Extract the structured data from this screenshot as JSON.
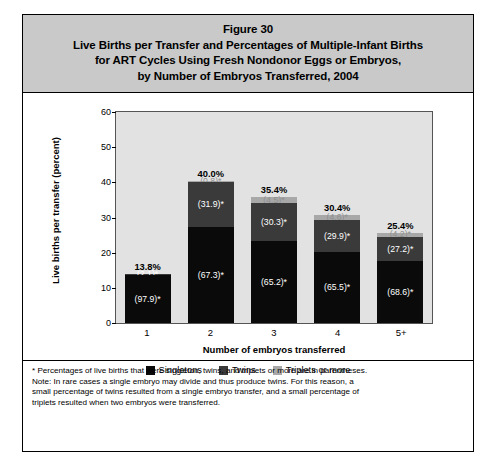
{
  "figure": {
    "title_lines": [
      "Figure 30",
      "Live Births per Transfer and Percentages of Multiple-Infant Births",
      "for ART Cycles Using Fresh Nondonor Eggs or Embryos,",
      "by Number of Embryos Transferred, 2004"
    ]
  },
  "footnotes": {
    "asterisk": "* Percentages of live births that were singleton, twins, and triplets or more are in parentheses.",
    "note_line1": "Note: In rare cases a single embryo may divide and thus produce twins. For this reason, a",
    "note_line2": "small percentage of twins resulted from a single embryo transfer, and a small percentage of",
    "note_line3": "triplets resulted when two embryos were transferred."
  },
  "colors": {
    "singletons": "#0a0a0a",
    "twins": "#3a3a3a",
    "triplets": "#a8a8a8",
    "plot_background": "#e2e2e2",
    "title_band": "#c9c9c9"
  },
  "chart_data": {
    "type": "bar",
    "subtype": "stacked-percentage",
    "title": "Live Births per Transfer and Percentages of Multiple-Infant Births for ART Cycles Using Fresh Nondonor Eggs or Embryos, by Number of Embryos Transferred, 2004",
    "xlabel": "Number of embryos transferred",
    "ylabel": "Live births per transfer (percent)",
    "ylim": [
      0,
      60
    ],
    "yticks": [
      0,
      10,
      20,
      30,
      40,
      50,
      60
    ],
    "ytick_labels": [
      "0",
      "10",
      "20",
      "30",
      "40",
      "50",
      "60"
    ],
    "grid": false,
    "legend_position": "bottom",
    "categories": [
      "1",
      "2",
      "3",
      "4",
      "5+"
    ],
    "values": [
      13.8,
      40.0,
      35.4,
      30.4,
      25.4
    ],
    "bar_total_labels": [
      "13.8%",
      "40.0%",
      "35.4%",
      "30.4%",
      "25.4%"
    ],
    "series": [
      {
        "name": "Singletons",
        "color": "#0a0a0a",
        "share_percent": [
          97.9,
          67.3,
          65.2,
          65.5,
          68.6
        ],
        "labels": [
          "(97.9)*",
          "(67.3)*",
          "(65.2)*",
          "(65.5)*",
          "(68.6)*"
        ]
      },
      {
        "name": "Twins",
        "color": "#3a3a3a",
        "share_percent": [
          2.1,
          31.9,
          30.3,
          29.9,
          27.2
        ],
        "labels": [
          "(2.1)*",
          "(31.9)*",
          "(30.3)*",
          "(29.9)*",
          "(27.2)*"
        ]
      },
      {
        "name": "Triplets or more",
        "color": "#a8a8a8",
        "share_percent": [
          0.0,
          0.8,
          4.5,
          4.6,
          4.2
        ],
        "labels": [
          "",
          "(0.8)*",
          "(4.5)*",
          "(4.6)*",
          "(4.2)*"
        ]
      }
    ],
    "legend": [
      "Singletons",
      "Twins",
      "Triplets or more"
    ]
  }
}
